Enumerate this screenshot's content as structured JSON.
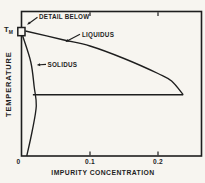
{
  "figure": {
    "axis": {
      "x_title": "IMPURITY CONCENTRATION",
      "y_title": "TEMPERATURE",
      "tm_main": "T",
      "tm_sub": "M"
    },
    "annotations": {
      "detail_below": "DETAIL BELOW",
      "liquidus": "LIQUIDUS",
      "solidus": "SOLIDUS"
    }
  },
  "colors": {
    "ink": "#1e1e1e",
    "paper": "#f7f5f0"
  },
  "chart_data": {
    "type": "line",
    "title": "",
    "xlabel": "IMPURITY CONCENTRATION",
    "ylabel": "TEMPERATURE",
    "xlim": [
      0,
      0.265
    ],
    "ylim": [
      0,
      1.05
    ],
    "y_units_note": "temperature in arbitrary units; 1.0 = TM (melting point) marked on y-axis, no numeric y ticks shown",
    "x_ticks": [
      0,
      0.1,
      0.2
    ],
    "x_tick_labels": [
      "0",
      "0.1",
      "0.2"
    ],
    "grid": false,
    "legend": "inline-annotations-with-arrows",
    "series": [
      {
        "name": "LIQUIDUS",
        "points": [
          [
            0.005,
            1.0
          ],
          [
            0.06,
            0.93
          ],
          [
            0.1,
            0.88
          ],
          [
            0.15,
            0.78
          ],
          [
            0.2,
            0.66
          ],
          [
            0.22,
            0.6
          ],
          [
            0.237,
            0.49
          ]
        ]
      },
      {
        "name": "SOLIDUS",
        "points": [
          [
            0.001,
            0.96
          ],
          [
            0.013,
            0.75
          ],
          [
            0.018,
            0.55
          ],
          [
            0.021,
            0.4
          ],
          [
            0.015,
            0.2
          ],
          [
            0.007,
            0.0
          ]
        ]
      },
      {
        "name": "TIE_LINE",
        "points": [
          [
            0.016,
            0.49
          ],
          [
            0.237,
            0.49
          ]
        ]
      }
    ],
    "annotations": [
      {
        "text": "DETAIL BELOW",
        "target": "small box at TM on temperature axis"
      },
      {
        "text": "LIQUIDUS",
        "target": "liquidus curve"
      },
      {
        "text": "SOLIDUS",
        "target": "solidus curve"
      },
      {
        "text": "TM",
        "target": "melting temperature on y-axis"
      }
    ]
  }
}
